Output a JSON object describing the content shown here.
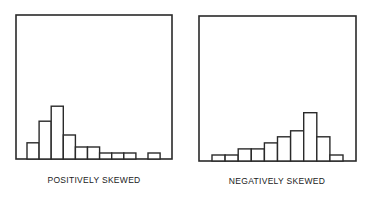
{
  "chart_data": [
    {
      "type": "bar",
      "title": "POSITIVELY SKEWED",
      "xlabel": "",
      "ylabel": "",
      "grid": false,
      "axes_ticks": false,
      "categories": [
        "1",
        "2",
        "3",
        "4",
        "5",
        "6",
        "7",
        "8",
        "9",
        "10",
        "11"
      ],
      "values": [
        2.7,
        6.3,
        8.8,
        4,
        2,
        2,
        1,
        1,
        1,
        0,
        1
      ],
      "ylim": [
        0,
        24
      ]
    },
    {
      "type": "bar",
      "title": "NEGATIVELY SKEWED",
      "xlabel": "",
      "ylabel": "",
      "grid": false,
      "axes_ticks": false,
      "categories": [
        "1",
        "2",
        "3",
        "4",
        "5",
        "6",
        "7",
        "8",
        "9",
        "10"
      ],
      "values": [
        1,
        1,
        2,
        2,
        3,
        4,
        5,
        8,
        4,
        1
      ],
      "ylim": [
        0,
        24
      ]
    }
  ]
}
